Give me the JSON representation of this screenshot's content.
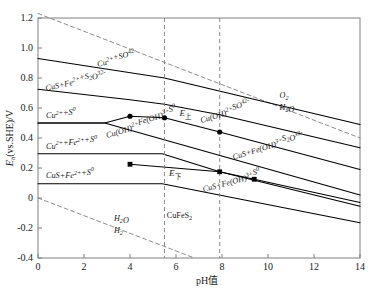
{
  "chart_data": {
    "type": "line",
    "title": "",
    "xlabel": "pH值",
    "ylabel": "Eh(vs.SHE)/V",
    "xlim": [
      0,
      14
    ],
    "ylim": [
      -0.4,
      1.2
    ],
    "xticks": [
      "0",
      "2",
      "4",
      "6",
      "8",
      "10",
      "12",
      "14"
    ],
    "xtick_values": [
      0,
      2,
      4,
      6,
      8,
      10,
      12,
      14
    ],
    "yticks": [
      "1.2",
      "1.0",
      "0.8",
      "0.6",
      "0.4",
      "0.2",
      "0",
      "-0.2",
      "-0.4"
    ],
    "ytick_values": [
      1.2,
      1.0,
      0.8,
      0.6,
      0.4,
      0.2,
      0.0,
      -0.2,
      -0.4
    ],
    "grid": false,
    "legend": "none",
    "series": [
      {
        "name": "O2/H2O water stability upper",
        "style": "dashed",
        "points": [
          [
            0,
            1.23
          ],
          [
            14,
            0.4
          ]
        ]
      },
      {
        "name": "H2O/H2 water stability lower",
        "style": "dashed",
        "points": [
          [
            0,
            0.0
          ],
          [
            6.8,
            -0.4
          ]
        ]
      },
      {
        "name": "Cu2+ + SO4(2-) / CuS+Fe2++S2O3(2-) boundary",
        "style": "solid",
        "points": [
          [
            0,
            0.93
          ],
          [
            5.5,
            0.8
          ],
          [
            14,
            0.49
          ]
        ]
      },
      {
        "name": "CuS+Fe2++S2O3(2-) / Cu(OH)2+SO4(2-) boundary",
        "style": "solid",
        "points": [
          [
            0,
            0.725
          ],
          [
            4.0,
            0.655
          ],
          [
            5.5,
            0.625
          ],
          [
            7.9,
            0.555
          ],
          [
            14,
            0.335
          ]
        ]
      },
      {
        "name": "E upper curve",
        "style": "solid",
        "points": [
          [
            0,
            0.5
          ],
          [
            2.9,
            0.5
          ],
          [
            4.0,
            0.545
          ],
          [
            5.5,
            0.535
          ],
          [
            7.9,
            0.44
          ],
          [
            14,
            0.19
          ]
        ]
      },
      {
        "name": "Cu2+ + S0 lower boundary",
        "style": "solid",
        "points": [
          [
            0,
            0.5
          ],
          [
            2.9,
            0.5
          ],
          [
            14,
            0.02
          ]
        ]
      },
      {
        "name": "Cu2+ + Fe2+ + S0 / Cu(OH)2+Fe(OH)3+S0 boundary",
        "style": "solid",
        "points": [
          [
            0,
            0.295
          ],
          [
            5.4,
            0.295
          ],
          [
            7.9,
            0.175
          ],
          [
            14,
            -0.055
          ]
        ]
      },
      {
        "name": "E lower curve",
        "style": "solid",
        "points": [
          [
            4.0,
            0.225
          ],
          [
            7.9,
            0.175
          ],
          [
            9.4,
            0.125
          ],
          [
            14,
            -0.03
          ]
        ]
      },
      {
        "name": "CuS+Fe2++S0 / CuFeS2 boundary",
        "style": "solid",
        "points": [
          [
            0,
            0.095
          ],
          [
            5.4,
            0.095
          ],
          [
            14,
            -0.165
          ]
        ]
      }
    ],
    "vertical_lines": [
      {
        "name": "pH marker left",
        "x": 5.5,
        "style": "dashed"
      },
      {
        "name": "pH marker right",
        "x": 7.9,
        "style": "dashed"
      }
    ],
    "markers": [
      {
        "shape": "circle",
        "x": 4.0,
        "y": 0.545
      },
      {
        "shape": "circle",
        "x": 5.5,
        "y": 0.535
      },
      {
        "shape": "circle",
        "x": 7.9,
        "y": 0.44
      },
      {
        "shape": "square",
        "x": 4.0,
        "y": 0.225
      },
      {
        "shape": "square",
        "x": 7.9,
        "y": 0.175
      },
      {
        "shape": "square",
        "x": 9.4,
        "y": 0.125
      }
    ],
    "annotations": [
      {
        "name": "region-cu2-so4",
        "text": "Cu2++SO42-",
        "x": 2.6,
        "y": 0.875,
        "rotate": -12
      },
      {
        "name": "region-cus-fe2-s2o3",
        "text": "CuS+Fe2++S2O32-",
        "x": 0.35,
        "y": 0.715,
        "rotate": -12
      },
      {
        "name": "region-cu2-s0",
        "text": "Cu2++S0",
        "x": 0.35,
        "y": 0.535,
        "rotate": 0
      },
      {
        "name": "region-cu2-fe2-s0",
        "text": "Cu2++Fe2++S0",
        "x": 0.35,
        "y": 0.33,
        "rotate": 0
      },
      {
        "name": "region-cus-fe2-s0",
        "text": "CuS+Fe2++S0",
        "x": 0.35,
        "y": 0.135,
        "rotate": 0
      },
      {
        "name": "region-cuoh2-feoh3-s0",
        "text": "Cu(OH)2+Fe(OH)3+S0",
        "x": 3.0,
        "y": 0.4,
        "rotate": -17
      },
      {
        "name": "region-cuoh2-so4",
        "text": "Cu(OH)2+SO42-",
        "x": 7.1,
        "y": 0.5,
        "rotate": -17
      },
      {
        "name": "region-cus-feoh3-s2o3",
        "text": "CuS+Fe(OH)3+S2O32-",
        "x": 8.5,
        "y": 0.255,
        "rotate": -17
      },
      {
        "name": "region-cus-feoh3-s0",
        "text": "CuS+Fe(OH)3+S0",
        "x": 7.2,
        "y": 0.04,
        "rotate": -15
      },
      {
        "name": "region-cufes2",
        "text": "CuFeS2",
        "x": 5.6,
        "y": -0.13,
        "rotate": 0
      },
      {
        "name": "water-upper-o2",
        "text": "O2",
        "x": 10.5,
        "y": 0.665,
        "rotate": 0
      },
      {
        "name": "water-upper-h2o",
        "text": "H2O",
        "x": 10.5,
        "y": 0.585,
        "rotate": 0
      },
      {
        "name": "water-lower-h2o",
        "text": "H2O",
        "x": 3.3,
        "y": -0.155,
        "rotate": 0
      },
      {
        "name": "water-lower-h2",
        "text": "H2",
        "x": 3.3,
        "y": -0.235,
        "rotate": 0
      },
      {
        "name": "e-upper",
        "text": "E上",
        "x": 6.15,
        "y": 0.545,
        "rotate": 0
      },
      {
        "name": "e-lower",
        "text": "E下",
        "x": 5.7,
        "y": 0.145,
        "rotate": 0
      }
    ]
  },
  "axis": {
    "x_title": "pH值",
    "y_title_main": "E",
    "y_title_sub": "h",
    "y_title_rest": "(vs.SHE)/V"
  },
  "colors": {
    "line": "#000000",
    "dashed": "#808080",
    "axis": "#808080",
    "text": "#1a1a1a",
    "background": "#ffffff"
  }
}
